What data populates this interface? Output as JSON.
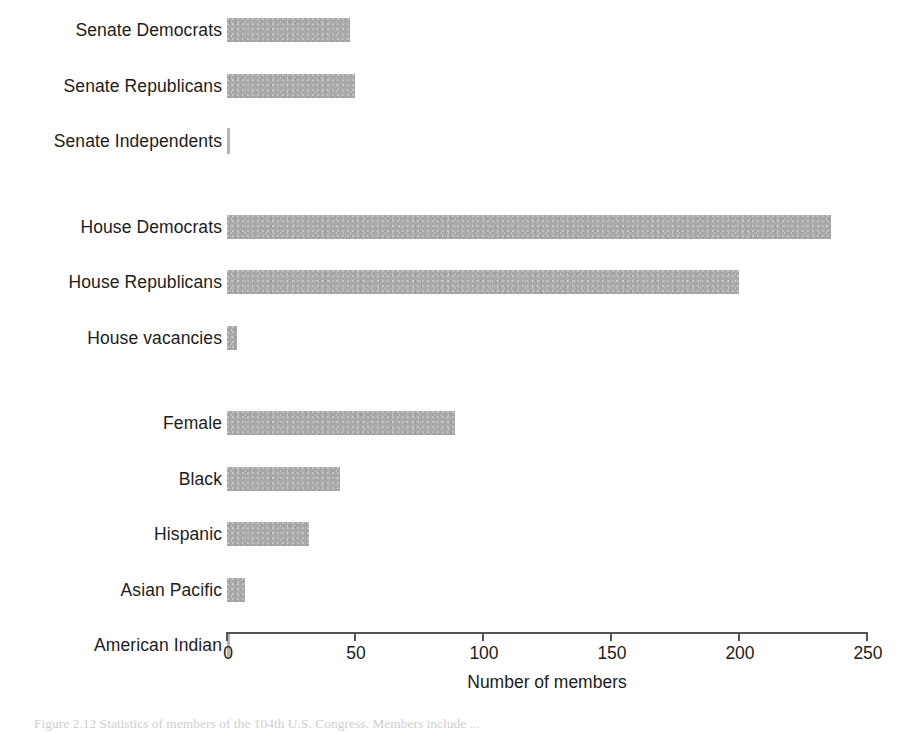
{
  "chart_data": {
    "type": "bar",
    "orientation": "horizontal",
    "title": "",
    "xlabel": "Number of members",
    "ylabel": "",
    "xlim": [
      0,
      250
    ],
    "xticks": [
      "0",
      "50",
      "100",
      "150",
      "200",
      "250"
    ],
    "xtick_values": [
      0,
      50,
      100,
      150,
      200,
      250
    ],
    "grid": false,
    "legend": false,
    "bar_color": "#a9a9a9",
    "axis_color": "#555555",
    "categories": [
      "Senate Democrats",
      "Senate Republicans",
      "Senate Independents",
      "House Democrats",
      "House Republicans",
      "House vacancies",
      "Female",
      "Black",
      "Hispanic",
      "Asian Pacific",
      "American Indian"
    ],
    "values": [
      48,
      50,
      1,
      236,
      200,
      4,
      89,
      44,
      32,
      7,
      1
    ],
    "group_breaks_after": [
      "Senate Independents",
      "House vacancies"
    ]
  },
  "axis": {
    "x_title": "Number of members",
    "ticks": [
      {
        "label": "0",
        "value": 0
      },
      {
        "label": "50",
        "value": 50
      },
      {
        "label": "100",
        "value": 100
      },
      {
        "label": "150",
        "value": 150
      },
      {
        "label": "200",
        "value": 200
      },
      {
        "label": "250",
        "value": 250
      }
    ]
  },
  "rows": [
    {
      "label": "Senate Democrats",
      "value": 48,
      "group": 0
    },
    {
      "label": "Senate Republicans",
      "value": 50,
      "group": 0
    },
    {
      "label": "Senate Independents",
      "value": 1,
      "group": 0
    },
    {
      "label": "House Democrats",
      "value": 236,
      "group": 1
    },
    {
      "label": "House Republicans",
      "value": 200,
      "group": 1
    },
    {
      "label": "House vacancies",
      "value": 4,
      "group": 1
    },
    {
      "label": "Female",
      "value": 89,
      "group": 2
    },
    {
      "label": "Black",
      "value": 44,
      "group": 2
    },
    {
      "label": "Hispanic",
      "value": 32,
      "group": 2
    },
    {
      "label": "Asian Pacific",
      "value": 7,
      "group": 2
    },
    {
      "label": "American Indian",
      "value": 1,
      "group": 2
    }
  ],
  "caption": {
    "text": "Figure 2.12  Statistics of members of the 104th U.S. Congress. Members include ..."
  }
}
